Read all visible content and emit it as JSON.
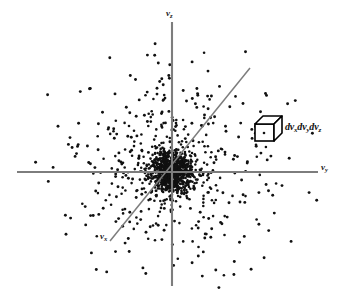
{
  "figure": {
    "background_color": "#ffffff",
    "axis_color": "#7d7d7d",
    "dot_color": "#111111",
    "cube_line_color": "#000000"
  },
  "axes": [
    {
      "name": "vz-axis",
      "label": "v",
      "subscript": "z",
      "orientation": "vertical",
      "x1": 172,
      "y1": 22,
      "x2": 172,
      "y2": 286,
      "label_x": 166,
      "label_y": 9
    },
    {
      "name": "vy-axis",
      "label": "v",
      "subscript": "y",
      "orientation": "horizontal",
      "x1": 17,
      "y1": 172,
      "x2": 318,
      "y2": 172,
      "label_x": 321,
      "label_y": 163
    },
    {
      "name": "vx-axis",
      "label": "v",
      "subscript": "x",
      "orientation": "diagonal",
      "x1": 110,
      "y1": 241,
      "x2": 250,
      "y2": 68,
      "label_x": 100,
      "label_y": 235
    }
  ],
  "volume_element": {
    "name": "volume-element-cube",
    "label_prefix": "dv",
    "label": "dvₓdvᵧdvᵩ",
    "terms": [
      {
        "d": "dv",
        "sub": "x"
      },
      {
        "d": "dv",
        "sub": "y"
      },
      {
        "d": "dv",
        "sub": "z"
      }
    ],
    "cube": {
      "front_x": 255,
      "front_y": 120,
      "size": 20,
      "depth": 9
    },
    "label_x": 281,
    "label_y": 121
  },
  "chart_data": {
    "type": "scatter",
    "title": "",
    "xlabel": "v_y",
    "ylabel": "v_z",
    "origin": {
      "x": 172,
      "y": 172
    },
    "radial_profile": {
      "core_radius_px": 26,
      "outer_radius_px": 150,
      "core_point_count": 900,
      "halo_point_count": 520,
      "falloff": "gaussian"
    },
    "legend_position": "none",
    "grid": false
  }
}
